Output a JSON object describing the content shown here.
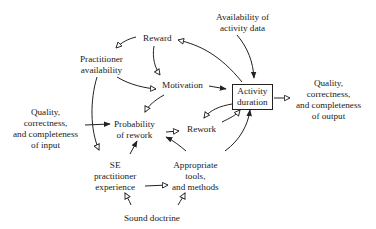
{
  "diagram": {
    "type": "causal-loop",
    "nodes": [
      {
        "id": "reward",
        "label": "Reward"
      },
      {
        "id": "availability_data",
        "label": "Availability of\nactivity data"
      },
      {
        "id": "practitioner_availability",
        "label": "Practitioner\navailability"
      },
      {
        "id": "motivation",
        "label": "Motivation"
      },
      {
        "id": "activity_duration",
        "label": "Activity\nduration"
      },
      {
        "id": "quality_output",
        "label": "Quality,\ncorrectness,\nand completeness\nof output"
      },
      {
        "id": "quality_input",
        "label": "Quality,\ncorrectness,\nand completeness\nof input"
      },
      {
        "id": "probability_rework",
        "label": "Probability\nof rework"
      },
      {
        "id": "rework",
        "label": "Rework"
      },
      {
        "id": "se_experience",
        "label": "SE\npractitioner\nexperience"
      },
      {
        "id": "tools_methods",
        "label": "Appropriate\ntools,\nand methods"
      },
      {
        "id": "sound_doctrine",
        "label": "Sound doctrine"
      }
    ],
    "edges": [
      {
        "from": "activity_duration",
        "to": "reward",
        "head": "open"
      },
      {
        "from": "reward",
        "to": "practitioner_availability",
        "head": "open"
      },
      {
        "from": "reward",
        "to": "motivation",
        "head": "open"
      },
      {
        "from": "practitioner_availability",
        "to": "motivation",
        "head": "open"
      },
      {
        "from": "practitioner_availability",
        "to": "se_experience",
        "head": "open"
      },
      {
        "from": "availability_data",
        "to": "activity_duration",
        "head": "filled"
      },
      {
        "from": "motivation",
        "to": "activity_duration",
        "head": "filled"
      },
      {
        "from": "motivation",
        "to": "probability_rework",
        "head": "open"
      },
      {
        "from": "activity_duration",
        "to": "quality_output",
        "head": "open"
      },
      {
        "from": "activity_duration",
        "to": "rework",
        "head": "open"
      },
      {
        "from": "rework",
        "to": "activity_duration",
        "head": "open"
      },
      {
        "from": "quality_input",
        "to": "probability_rework",
        "head": "filled"
      },
      {
        "from": "probability_rework",
        "to": "rework",
        "head": "open"
      },
      {
        "from": "se_experience",
        "to": "probability_rework",
        "head": "filled"
      },
      {
        "from": "tools_methods",
        "to": "probability_rework",
        "head": "filled"
      },
      {
        "from": "tools_methods",
        "to": "activity_duration",
        "head": "filled"
      },
      {
        "from": "se_experience",
        "to": "tools_methods",
        "head": "open"
      },
      {
        "from": "sound_doctrine",
        "to": "se_experience",
        "head": "open"
      },
      {
        "from": "sound_doctrine",
        "to": "tools_methods",
        "head": "open"
      }
    ]
  },
  "labels": {
    "reward": "Reward",
    "availability_data": "Availability of\nactivity data",
    "practitioner_availability": "Practitioner\navailability",
    "motivation": "Motivation",
    "activity_duration": "Activity\nduration",
    "quality_output": "Quality,\ncorrectness,\nand completeness\nof output",
    "quality_input": "Quality,\ncorrectness,\nand completeness\nof input",
    "probability_rework": "Probability\nof rework",
    "rework": "Rework",
    "se_experience": "SE\npractitioner\nexperience",
    "tools_methods": "Appropriate\ntools,\nand methods",
    "sound_doctrine": "Sound doctrine"
  }
}
